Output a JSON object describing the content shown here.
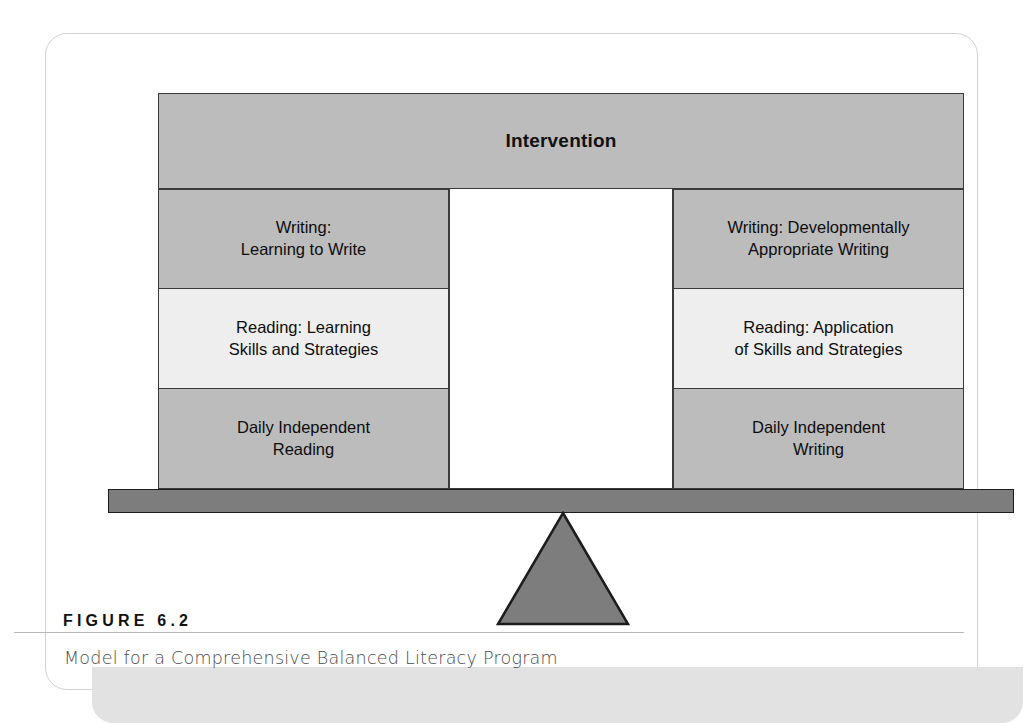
{
  "figure": {
    "label": "FIGURE 6.2",
    "caption": "Model for a Comprehensive Balanced Literacy Program"
  },
  "diagram": {
    "type": "balance-scale",
    "header": {
      "title": "Intervention"
    },
    "left_pan": {
      "name": "left-pan",
      "cells": [
        {
          "text": "Writing:\nLearning to Write",
          "shade": "dark"
        },
        {
          "text": "Reading: Learning\nSkills and Strategies",
          "shade": "light"
        },
        {
          "text": "Daily Independent\nReading",
          "shade": "dark"
        }
      ]
    },
    "center_gap": {
      "name": "center-gap",
      "text": ""
    },
    "right_pan": {
      "name": "right-pan",
      "cells": [
        {
          "text": "Writing: Developmentally\nAppropriate Writing",
          "shade": "dark"
        },
        {
          "text": "Reading: Application\nof Skills and Strategies",
          "shade": "light"
        },
        {
          "text": "Daily Independent\nWriting",
          "shade": "dark"
        }
      ]
    },
    "beam": {
      "name": "balance-beam"
    },
    "fulcrum": {
      "name": "fulcrum-triangle"
    }
  },
  "colors": {
    "cell_dark": "#bcbcbc",
    "cell_light": "#eeeeee",
    "cell_border": "#3a3a3a",
    "beam_fill": "#7d7d7d",
    "beam_border": "#1c1c1c",
    "fulcrum_fill": "#7d7d7d",
    "fulcrum_border": "#1c1c1c",
    "caption_band": "#e2e2e2",
    "card_border": "#d2d2d2",
    "rule": "#b9b9b9",
    "text_dark": "#0d0d0d",
    "caption_text": "#4a4a4a"
  }
}
